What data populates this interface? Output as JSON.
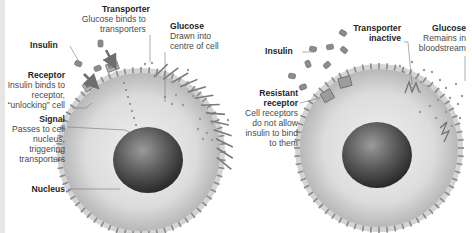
{
  "colors": {
    "cytoplasm_light": "#e9e9e9",
    "cytoplasm_dark": "#bdbdbd",
    "membrane": "#d2d2d2",
    "spike": "#8a8a8a",
    "nucleus_light": "#8a8a8a",
    "nucleus_dark": "#2b2b2b",
    "insulin": "#8c8c8c",
    "arrow": "#6e6e6e",
    "glucose": "#9a9a9a",
    "leader_line": "#777777",
    "edge_strip": "#e6e6e6"
  },
  "left_panel": {
    "labels": {
      "transporter": {
        "title": "Transporter",
        "desc": [
          "Glucose binds to",
          "transporters"
        ]
      },
      "glucose": {
        "title": "Glucose",
        "desc": [
          "Drawn into",
          "centre of cell"
        ]
      },
      "insulin": {
        "title": "Insulin",
        "desc": []
      },
      "receptor": {
        "title": "Receptor",
        "desc": [
          "Insulin binds to",
          "receptor,",
          "“unlocking” cell"
        ]
      },
      "signal": {
        "title": "Signal",
        "desc": [
          "Passes to cell",
          "nucleus,",
          "triggering",
          "transporters"
        ]
      },
      "nucleus": {
        "title": "Nucleus",
        "desc": []
      }
    }
  },
  "right_panel": {
    "labels": {
      "transporter_inactive": {
        "title": "Transporter",
        "title2": "inactive"
      },
      "glucose": {
        "title": "Glucose",
        "desc": [
          "Remains in",
          "bloodstream"
        ]
      },
      "insulin": {
        "title": "Insulin"
      },
      "resistant_receptor": {
        "title": "Resistant",
        "title2": "receptor",
        "desc": [
          "Cell receptors",
          "do not allow",
          "insulin to bind",
          "to them"
        ]
      }
    }
  }
}
